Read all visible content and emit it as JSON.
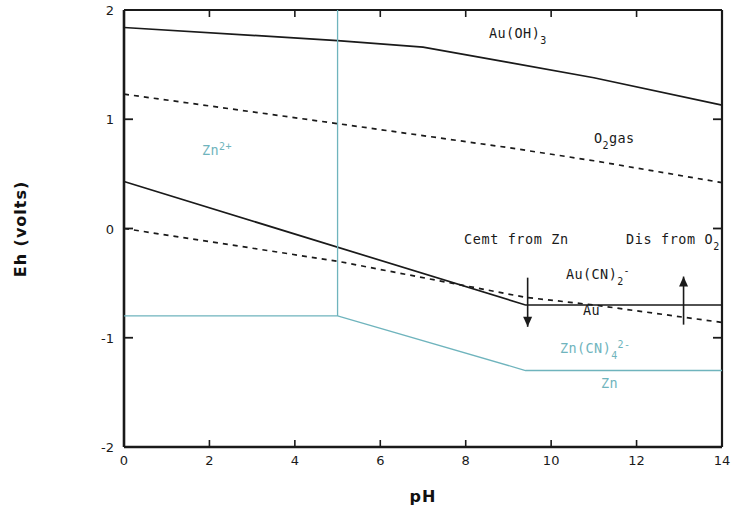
{
  "chart_data": {
    "type": "line",
    "title": "",
    "xlabel": "pH",
    "ylabel": "Eh (volts)",
    "xlim": [
      0,
      14
    ],
    "ylim": [
      -2,
      2
    ],
    "xticks": [
      0,
      2,
      4,
      6,
      8,
      10,
      12,
      14
    ],
    "xtick_labels": [
      "0",
      "2",
      "4",
      "6",
      "8",
      "10",
      "12",
      "14"
    ],
    "yticks": [
      -2,
      -1,
      0,
      1,
      2
    ],
    "ytick_labels": [
      "-2",
      "-1",
      "0",
      "1",
      "2"
    ],
    "grid": false,
    "legend_position": "inline-annotations",
    "series": [
      {
        "name": "Au(OH)3 boundary",
        "style": "solid",
        "color": "#1a1a1a",
        "points": [
          [
            0,
            1.84
          ],
          [
            5,
            1.72
          ],
          [
            7,
            1.66
          ],
          [
            9,
            1.52
          ],
          [
            11,
            1.38
          ],
          [
            14,
            1.13
          ]
        ]
      },
      {
        "name": "O2 gas line",
        "style": "dashed",
        "color": "#1a1a1a",
        "points": [
          [
            0,
            1.23
          ],
          [
            5,
            0.96
          ],
          [
            9,
            0.74
          ],
          [
            11,
            0.62
          ],
          [
            14,
            0.42
          ]
        ]
      },
      {
        "name": "Au(CN)2- / Au boundary (solid)",
        "style": "solid",
        "color": "#1a1a1a",
        "points": [
          [
            0,
            0.43
          ],
          [
            9.4,
            -0.7
          ],
          [
            14,
            -0.7
          ]
        ]
      },
      {
        "name": "H2 / water lower line (dashed)",
        "style": "dashed",
        "color": "#1a1a1a",
        "points": [
          [
            0,
            0.0
          ],
          [
            5,
            -0.3
          ],
          [
            9.4,
            -0.63
          ],
          [
            11,
            -0.7
          ],
          [
            14,
            -0.86
          ]
        ]
      },
      {
        "name": "Zn2+ / Zn(CN)4 2- boundary (cyan)",
        "style": "solid",
        "color": "#6fb4bd",
        "points": [
          [
            0,
            -0.8
          ],
          [
            5,
            -0.8
          ],
          [
            9.4,
            -1.3
          ],
          [
            14,
            -1.3
          ]
        ]
      },
      {
        "name": "Zn vertical boundary at pH 5 (cyan)",
        "style": "solid",
        "color": "#6fb4bd",
        "points": [
          [
            5,
            2.0
          ],
          [
            5,
            -0.8
          ]
        ]
      }
    ],
    "annotations": [
      {
        "name": "au-oh-3-label",
        "text": "Au(OH)",
        "sub": "3",
        "x": 8.1,
        "y": 1.78,
        "color": "#1a1a1a"
      },
      {
        "name": "o2-gas-label",
        "text": "O",
        "sub": "2",
        "suffix": "gas",
        "x": 10.3,
        "y": 1.02,
        "color": "#1a1a1a"
      },
      {
        "name": "zn2plus-label",
        "text": "Zn",
        "sup": "2+",
        "x": 2.4,
        "y": 0.85,
        "color": "#6fb4bd"
      },
      {
        "name": "cemt-from-zn-label",
        "text": "Cemt from Zn",
        "x": 8.0,
        "y": 0.02,
        "color": "#1a1a1a"
      },
      {
        "name": "dis-from-o2-label",
        "text": "Dis from O",
        "sub": "2",
        "x": 12.1,
        "y": 0.02,
        "color": "#1a1a1a"
      },
      {
        "name": "au-cn-2-label",
        "text": "Au(CN)",
        "sub": "2",
        "sup": "-",
        "x": 10.1,
        "y": -0.51,
        "color": "#1a1a1a"
      },
      {
        "name": "au-label",
        "text": "Au",
        "x": 10.5,
        "y": -0.83,
        "color": "#1a1a1a"
      },
      {
        "name": "zn-cn-4-label",
        "text": "Zn(CN)",
        "sub": "4",
        "sup": "2-",
        "x": 9.9,
        "y": -1.18,
        "color": "#6fb4bd"
      },
      {
        "name": "zn-label",
        "text": "Zn",
        "x": 10.4,
        "y": -1.48,
        "color": "#6fb4bd"
      }
    ],
    "arrows": [
      {
        "name": "cementation-arrow",
        "direction": "down",
        "x": 9.45,
        "y_from": -0.45,
        "y_to": -0.9,
        "color": "#1a1a1a"
      },
      {
        "name": "dissolution-arrow",
        "direction": "up",
        "x": 13.1,
        "y_from": -0.88,
        "y_to": -0.44,
        "color": "#1a1a1a"
      }
    ]
  },
  "labels": {
    "x_axis_title": "pH",
    "y_axis_title": "Eh (volts)",
    "xticks": [
      "0",
      "2",
      "4",
      "6",
      "8",
      "10",
      "12",
      "14"
    ],
    "yticks": [
      "2",
      "1",
      "0",
      "-1",
      "-2"
    ],
    "au_oh3_base": "Au(OH)",
    "au_oh3_sub": "3",
    "o2_base": "O",
    "o2_sub": "2",
    "o2_suffix": "gas",
    "zn2plus_base": "Zn",
    "zn2plus_sup": "2+",
    "cemt_from_zn": "Cemt from Zn",
    "dis_from_o_base": "Dis from O",
    "dis_from_o_sub": "2",
    "au_cn2_base": "Au(CN)",
    "au_cn2_sub": "2",
    "au_cn2_sup": "-",
    "au": "Au",
    "zn_cn4_base": "Zn(CN)",
    "zn_cn4_sub": "4",
    "zn_cn4_sup": "2-",
    "zn": "Zn"
  },
  "colors": {
    "axis": "#1a1a1a",
    "line_black": "#1a1a1a",
    "line_cyan": "#6fb4bd",
    "background": "#ffffff"
  }
}
